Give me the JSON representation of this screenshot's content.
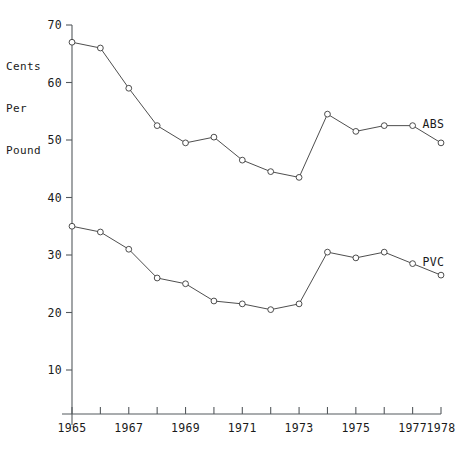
{
  "chart_data": {
    "type": "line",
    "title": "",
    "xlabel": "",
    "ylabel": "Cents Per Pound",
    "ylabel_lines": [
      "Cents",
      "Per",
      "Pound"
    ],
    "x": [
      1965,
      1966,
      1967,
      1968,
      1969,
      1970,
      1971,
      1972,
      1973,
      1974,
      1975,
      1976,
      1977,
      1978
    ],
    "categories": [
      "1965",
      "1966",
      "1967",
      "1968",
      "1969",
      "1970",
      "1971",
      "1972",
      "1973",
      "1974",
      "1975",
      "1976",
      "1977",
      "1978"
    ],
    "xtick_labels": [
      "1965",
      "1967",
      "1969",
      "1971",
      "1973",
      "1975",
      "1977",
      "1978"
    ],
    "xtick_values": [
      1965,
      1967,
      1969,
      1971,
      1973,
      1975,
      1977,
      1978
    ],
    "ytick_labels": [
      "10",
      "20",
      "30",
      "40",
      "50",
      "60",
      "70"
    ],
    "ytick_values": [
      10,
      20,
      30,
      40,
      50,
      60,
      70
    ],
    "xlim": [
      1965,
      1978
    ],
    "ylim": [
      0,
      70
    ],
    "grid": false,
    "legend_position": "inline-right",
    "marker": "open-circle",
    "series": [
      {
        "name": "ABS",
        "label": "ABS",
        "color": "#3a3a3a",
        "values": [
          67,
          66,
          59,
          52.5,
          49.5,
          50.5,
          46.5,
          44.5,
          43.5,
          54.5,
          51.5,
          52.5,
          52.5,
          49.5
        ]
      },
      {
        "name": "PVC",
        "label": "PVC",
        "color": "#3a3a3a",
        "values": [
          35,
          34,
          31,
          26,
          25,
          22,
          21.5,
          20.5,
          21.5,
          30.5,
          29.5,
          30.5,
          28.5,
          26.5
        ]
      }
    ]
  },
  "axis_title": {
    "line1": "Cents",
    "line2": "Per",
    "line3": "Pound"
  }
}
